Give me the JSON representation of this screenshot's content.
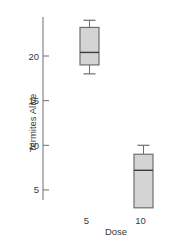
{
  "chart_data": {
    "type": "box",
    "title": "",
    "xlabel": "Dose",
    "ylabel": "Termites Alive",
    "categories": [
      "5",
      "10"
    ],
    "yticks": [
      5,
      10,
      15,
      20
    ],
    "ylim": [
      3.5,
      25
    ],
    "grid": false,
    "legend": null,
    "boxes": [
      {
        "category": "5",
        "whisker_low": 18,
        "q1": 19,
        "median": 20.4,
        "q3": 23.2,
        "whisker_high": 24
      },
      {
        "category": "10",
        "whisker_low": 3,
        "q1": 3,
        "median": 7.2,
        "q3": 9,
        "whisker_high": 10
      }
    ],
    "colors": {
      "box_fill": "#d4d4d4",
      "box_stroke": "#6e6e6e",
      "median": "#3c3c3c",
      "axis": "#6e6e6e"
    }
  }
}
